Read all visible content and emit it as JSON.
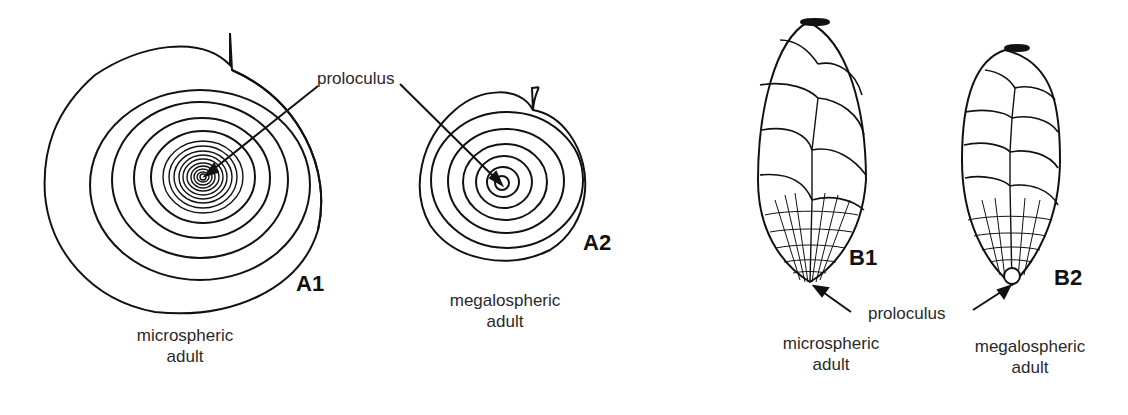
{
  "figure": {
    "panels": [
      {
        "id": "A1",
        "label": "A1",
        "caption_line1": "microspheric",
        "caption_line2": "adult",
        "form": "planispiral"
      },
      {
        "id": "A2",
        "label": "A2",
        "caption_line1": "megalospheric",
        "caption_line2": "adult",
        "form": "planispiral"
      },
      {
        "id": "B1",
        "label": "B1",
        "caption_line1": "microspheric",
        "caption_line2": "adult",
        "form": "biserial"
      },
      {
        "id": "B2",
        "label": "B2",
        "caption_line1": "megalospheric",
        "caption_line2": "adult",
        "form": "biserial"
      }
    ],
    "annotations": {
      "proloculus_top": "proloculus",
      "proloculus_bottom": "proloculus"
    }
  }
}
